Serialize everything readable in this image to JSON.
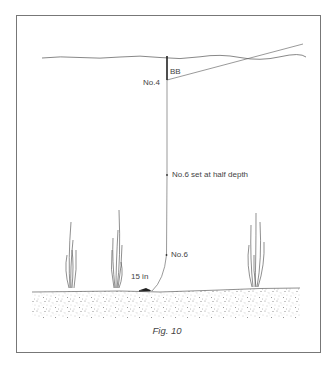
{
  "figure": {
    "caption": "Fig. 10"
  },
  "labels": {
    "bb": "BB",
    "no4": "No.4",
    "no6_half": "No.6 set at half depth",
    "no6": "No.6",
    "depth_15in": "15 in"
  },
  "colors": {
    "line": "#444444",
    "frame": "#777777",
    "sediment": "#888888"
  }
}
